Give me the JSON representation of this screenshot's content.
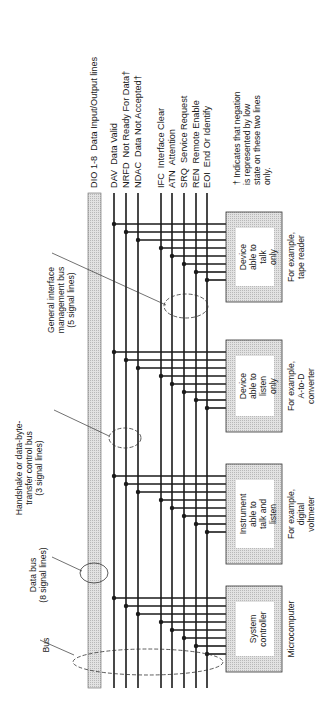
{
  "signals": {
    "data_bus": {
      "code": "DIO 1-8",
      "name": "Data Input/Output lines"
    },
    "handshake": [
      {
        "code": "DAV",
        "name": "Data Valid"
      },
      {
        "code": "NRFD",
        "name": "Not Ready For Data†"
      },
      {
        "code": "NDAC",
        "name": "Data Not Accepted†"
      }
    ],
    "management": [
      {
        "code": "IFC",
        "name": "Interface Clear"
      },
      {
        "code": "ATN",
        "name": "Attention"
      },
      {
        "code": "SRQ",
        "name": "Service Request"
      },
      {
        "code": "REN",
        "name": "Remote Enable"
      },
      {
        "code": "EOI",
        "name": "End Or Identify"
      }
    ]
  },
  "footnote": [
    "† Indicates that negation",
    "is represented by low",
    "state on these two lines",
    "only."
  ],
  "annotations": {
    "general": [
      "General interface",
      "management bus",
      "(5 signal lines)"
    ],
    "handshake": [
      "Handshake or data-byte-",
      "transfer control bus",
      "(3 signal lines)"
    ],
    "data_bus": [
      "Data bus",
      "(8 signal lines)"
    ],
    "bus": [
      "Bus"
    ]
  },
  "devices": [
    {
      "label": [
        "Device",
        "able to",
        "talk",
        "only"
      ],
      "example": [
        "For example,",
        "tape reader"
      ]
    },
    {
      "label": [
        "Device",
        "able to",
        "listen",
        "only"
      ],
      "example": [
        "For example,",
        "A-to-D",
        "converter"
      ]
    },
    {
      "label": [
        "Instrument",
        "able to",
        "talk and",
        "listen"
      ],
      "example": [
        "For example,",
        "digital",
        "voltmeter"
      ]
    },
    {
      "label": [
        "System",
        "controller"
      ],
      "example": [
        "Microcomputer"
      ]
    }
  ],
  "colors": {
    "line": "#1a1a1a",
    "shade": "#cfcfcf",
    "box": "#d4d4d4",
    "box_inner": "#ffffff"
  }
}
